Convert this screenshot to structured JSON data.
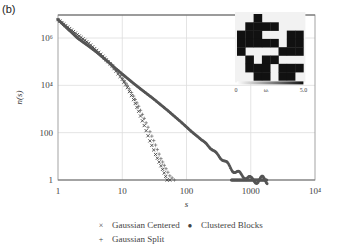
{
  "panel_label": "(b)",
  "chart_data": {
    "type": "scatter",
    "title": "",
    "xlabel": "s",
    "ylabel": "n(s)",
    "xscale": "log",
    "yscale": "log",
    "xlim": [
      1,
      10000
    ],
    "ylim": [
      1,
      10000000
    ],
    "x_ticks": [
      "1",
      "10",
      "100",
      "1000",
      "10⁴"
    ],
    "y_ticks": [
      "1",
      "100",
      "10⁴",
      "10⁶"
    ],
    "grid": true,
    "legend_position": "below",
    "series": [
      {
        "name": "Gaussian Centered",
        "marker": "x",
        "x": [
          1,
          2,
          3,
          4,
          5,
          6,
          7,
          8,
          10,
          12,
          15,
          18,
          22,
          27,
          33,
          40,
          45,
          50,
          55
        ],
        "y": [
          6000000,
          1400000,
          600000,
          300000,
          170000,
          100000,
          65000,
          40000,
          18000,
          8000,
          2500,
          800,
          200,
          45,
          12,
          4,
          2,
          1,
          1
        ]
      },
      {
        "name": "Gaussian Split",
        "marker": "+",
        "x": [
          1,
          2,
          3,
          4,
          5,
          6,
          7,
          8,
          10,
          12,
          15,
          18,
          22,
          27,
          33,
          40,
          48,
          55,
          65
        ],
        "y": [
          6000000,
          1100000,
          500000,
          260000,
          150000,
          95000,
          62000,
          42000,
          20000,
          10000,
          3500,
          1300,
          400,
          110,
          30,
          8,
          3,
          1.5,
          1
        ]
      },
      {
        "name": "Clustered Blocks",
        "marker": "o",
        "x": [
          1,
          2,
          3,
          4,
          5,
          6,
          8,
          10,
          15,
          20,
          30,
          50,
          80,
          120,
          200,
          300,
          400,
          500,
          600,
          800,
          1000,
          1300,
          1800
        ],
        "y": [
          6000000,
          1000000,
          450000,
          250000,
          150000,
          100000,
          50000,
          30000,
          12000,
          6500,
          2800,
          900,
          300,
          110,
          35,
          12,
          6,
          3,
          2,
          1.5,
          1,
          1,
          1
        ]
      }
    ],
    "inset": {
      "type": "heatmap",
      "grid": [
        [
          0,
          0,
          1,
          0,
          0,
          0,
          0,
          0
        ],
        [
          0,
          1,
          1,
          1,
          1,
          0,
          0,
          0
        ],
        [
          1,
          1,
          1,
          0,
          0,
          0,
          1,
          1
        ],
        [
          1,
          1,
          1,
          1,
          1,
          0,
          1,
          1
        ],
        [
          1,
          0,
          0,
          0,
          0,
          1,
          1,
          1
        ],
        [
          0,
          1,
          0,
          1,
          1,
          0,
          0,
          0
        ],
        [
          0,
          1,
          1,
          1,
          0,
          1,
          1,
          1
        ],
        [
          0,
          0,
          1,
          1,
          0,
          1,
          1,
          0
        ]
      ],
      "colorbar_min": "0",
      "colorbar_label": "ωᵢ",
      "colorbar_max": "5.0"
    }
  },
  "legend": {
    "items": [
      {
        "marker": "×",
        "label": "Gaussian Centered"
      },
      {
        "marker": "●",
        "label": "Clustered Blocks"
      },
      {
        "marker": "+",
        "label": "Gaussian Split"
      }
    ]
  },
  "colors": {
    "frame": "#9a9a9a",
    "grid": "#dddddd",
    "markers_dark": "#333333",
    "markers_cluster": "#555555"
  }
}
